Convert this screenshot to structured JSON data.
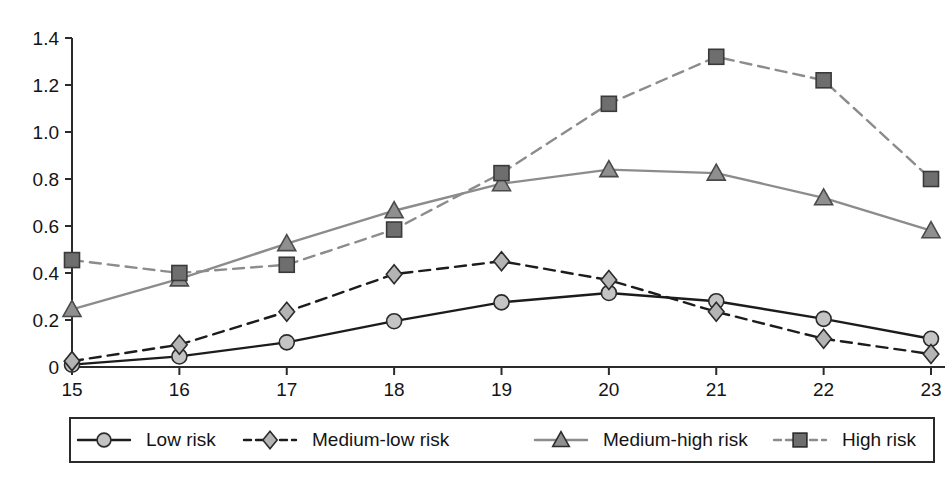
{
  "chart_data": {
    "type": "line",
    "title": "",
    "xlabel": "",
    "ylabel": "",
    "categories": [
      "15",
      "16",
      "17",
      "18",
      "19",
      "20",
      "21",
      "22",
      "23"
    ],
    "x": [
      15,
      16,
      17,
      18,
      19,
      20,
      21,
      22,
      23
    ],
    "xlim": [
      15,
      23
    ],
    "ylim": [
      0,
      1.4
    ],
    "grid": false,
    "legend_position": "bottom",
    "y_ticks": [
      "0",
      "0.2",
      "0.4",
      "0.6",
      "0.8",
      "1.0",
      "1.2",
      "1.4"
    ],
    "y_tick_values": [
      0,
      0.2,
      0.4,
      0.6,
      0.8,
      1.0,
      1.2,
      1.4
    ],
    "series": [
      {
        "name": "Low risk",
        "values": [
          0.01,
          0.045,
          0.105,
          0.195,
          0.275,
          0.315,
          0.28,
          0.205,
          0.12
        ],
        "marker": "circle",
        "line_style": "solid",
        "line_color": "#1c1c1c",
        "marker_fill": "#c4c4c4",
        "marker_stroke": "#2b2b2b"
      },
      {
        "name": "Medium-low risk",
        "values": [
          0.025,
          0.095,
          0.235,
          0.395,
          0.45,
          0.37,
          0.235,
          0.12,
          0.055
        ],
        "marker": "diamond",
        "line_style": "dashed",
        "line_color": "#1c1c1c",
        "marker_fill": "#b4b4b4",
        "marker_stroke": "#2b2b2b"
      },
      {
        "name": "Medium-high risk",
        "values": [
          0.245,
          0.375,
          0.525,
          0.665,
          0.78,
          0.84,
          0.825,
          0.72,
          0.58
        ],
        "marker": "triangle",
        "line_style": "solid",
        "line_color": "#8c8c8c",
        "marker_fill": "#8f8f8f",
        "marker_stroke": "#4a4a4a"
      },
      {
        "name": "High risk",
        "values": [
          0.455,
          0.4,
          0.435,
          0.585,
          0.825,
          1.12,
          1.32,
          1.22,
          0.8
        ],
        "marker": "square",
        "line_style": "dashed",
        "line_color": "#8c8c8c",
        "marker_fill": "#6e6e6e",
        "marker_stroke": "#3a3a3a"
      }
    ]
  },
  "legend": {
    "items": [
      {
        "label": "Low risk",
        "marker": "circle",
        "line_style": "solid",
        "color": "#1c1c1c",
        "marker_fill": "#c4c4c4"
      },
      {
        "label": "Medium-low risk",
        "marker": "diamond",
        "line_style": "dashed",
        "color": "#1c1c1c",
        "marker_fill": "#b4b4b4"
      },
      {
        "label": "Medium-high risk",
        "marker": "triangle",
        "line_style": "solid",
        "color": "#8c8c8c",
        "marker_fill": "#8f8f8f"
      },
      {
        "label": "High risk",
        "marker": "square",
        "line_style": "dashed",
        "color": "#8c8c8c",
        "marker_fill": "#6e6e6e"
      }
    ]
  }
}
